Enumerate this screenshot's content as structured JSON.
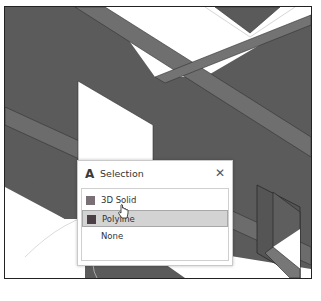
{
  "colors": {
    "wall_dark": "#5a5a5a",
    "wall_mid": "#6e6e6e",
    "wall_edge": "#7a7a7a",
    "floor": "#ffffff",
    "outline": "#222222"
  },
  "popup": {
    "app_icon": "A",
    "title": "Selection",
    "close_label": "✕",
    "items": [
      {
        "label": "3D Solid",
        "swatch_color": "#7a6f75",
        "selected": false
      },
      {
        "label": "Polyline",
        "swatch_color": "#4a3f45",
        "selected": true
      },
      {
        "label": "None",
        "swatch_color": null,
        "selected": false
      }
    ]
  }
}
